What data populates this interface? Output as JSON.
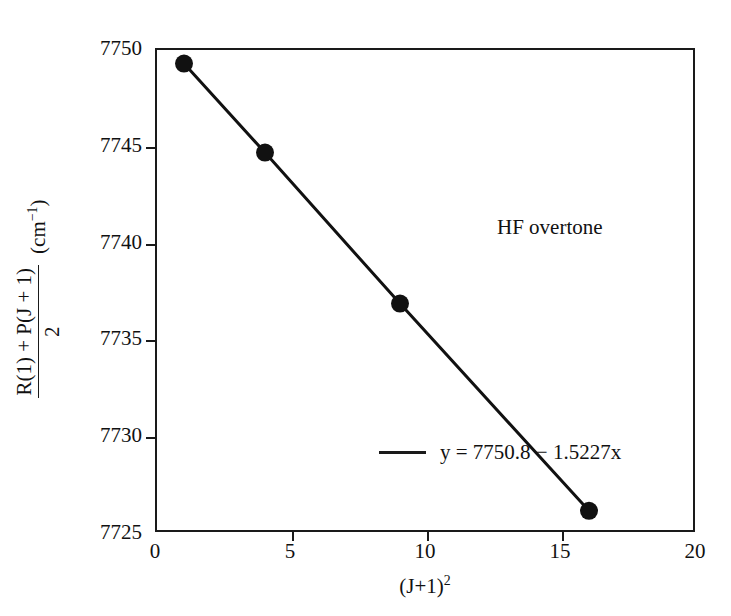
{
  "chart_data": {
    "type": "scatter",
    "title": "",
    "annotation": "HF overtone",
    "xlabel_text": "(J+1)",
    "xlabel_sup": "2",
    "ylabel_numerator": "R(1) + P(J + 1)",
    "ylabel_denominator": "2",
    "ylabel_units_text": "(cm",
    "ylabel_units_sup": "−1",
    "ylabel_units_close": ")",
    "x": [
      1,
      4,
      9,
      16
    ],
    "values": [
      7749.3,
      7744.7,
      7736.9,
      7726.2
    ],
    "series": [
      {
        "name": "y = 7750.8 − 1.5227x",
        "x": [
          1,
          4,
          9,
          16
        ],
        "values": [
          7749.3,
          7744.7,
          7736.9,
          7726.2
        ]
      }
    ],
    "fit": {
      "label": "y = 7750.8 − 1.5227x",
      "intercept": 7750.8,
      "slope": -1.5227
    },
    "xlim": [
      0,
      20
    ],
    "ylim": [
      7725,
      7750
    ],
    "xticks": [
      "0",
      "5",
      "10",
      "15",
      "20"
    ],
    "xtick_values": [
      0,
      5,
      10,
      15,
      20
    ],
    "yticks": [
      "7750",
      "7745",
      "7740",
      "7735",
      "7730",
      "7725"
    ],
    "ytick_values": [
      7750,
      7745,
      7740,
      7735,
      7730,
      7725
    ],
    "grid": false,
    "legend_position": "inside-lower-left",
    "marker_color": "#111111",
    "line_color": "#111111",
    "axis_color": "#1a1a1a",
    "background_color": "#ffffff"
  }
}
